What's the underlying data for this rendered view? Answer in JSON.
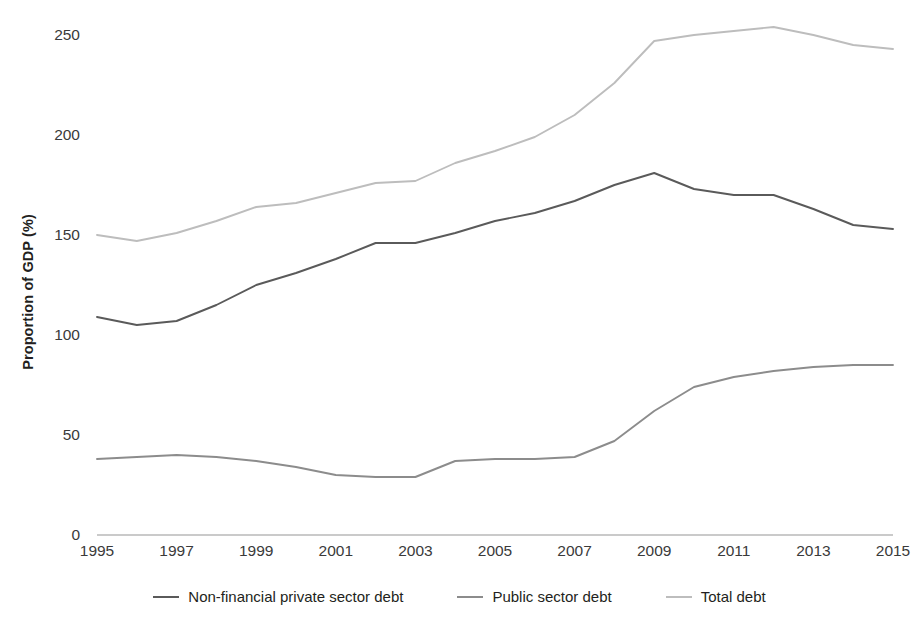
{
  "axes": {
    "y_title": "Proportion of GDP (%)",
    "y_ticks": [
      "0",
      "50",
      "100",
      "150",
      "200",
      "250"
    ],
    "x_ticks": [
      "1995",
      "1997",
      "1999",
      "2001",
      "2003",
      "2005",
      "2007",
      "2009",
      "2011",
      "2013",
      "2015"
    ]
  },
  "legend": {
    "items": [
      {
        "label": "Non-financial private sector debt",
        "color": "#5a5a5a"
      },
      {
        "label": "Public sector debt",
        "color": "#8c8c8c"
      },
      {
        "label": "Total debt",
        "color": "#bdbdbd"
      }
    ]
  },
  "chart_data": {
    "type": "line",
    "title": "",
    "xlabel": "",
    "ylabel": "Proportion of GDP (%)",
    "xlim": [
      1995,
      2015
    ],
    "ylim": [
      0,
      250
    ],
    "ytick_values": [
      0,
      50,
      100,
      150,
      200,
      250
    ],
    "xtick_values": [
      1995,
      1997,
      1999,
      2001,
      2003,
      2005,
      2007,
      2009,
      2011,
      2013,
      2015
    ],
    "grid": false,
    "legend_position": "bottom",
    "x": [
      1995,
      1996,
      1997,
      1998,
      1999,
      2000,
      2001,
      2002,
      2003,
      2004,
      2005,
      2006,
      2007,
      2008,
      2009,
      2010,
      2011,
      2012,
      2013,
      2014,
      2015
    ],
    "series": [
      {
        "name": "Non-financial private sector debt",
        "color": "#5a5a5a",
        "values": [
          109,
          105,
          107,
          115,
          125,
          131,
          138,
          146,
          146,
          151,
          157,
          161,
          167,
          175,
          181,
          173,
          170,
          170,
          163,
          155,
          153
        ]
      },
      {
        "name": "Public sector debt",
        "color": "#8c8c8c",
        "values": [
          38,
          39,
          40,
          39,
          37,
          34,
          30,
          29,
          29,
          37,
          38,
          38,
          39,
          47,
          62,
          74,
          79,
          82,
          84,
          85,
          85
        ]
      },
      {
        "name": "Total debt",
        "color": "#bdbdbd",
        "values": [
          150,
          147,
          151,
          157,
          164,
          166,
          171,
          176,
          177,
          186,
          192,
          199,
          210,
          226,
          247,
          250,
          252,
          254,
          250,
          245,
          243
        ]
      }
    ]
  }
}
